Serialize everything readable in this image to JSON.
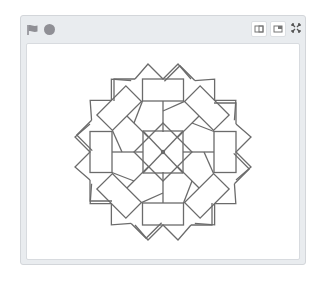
{
  "toolbar": {
    "green_flag": "green-flag-icon",
    "stop": "stop-icon",
    "buttons": [
      {
        "name": "small-stage-button",
        "icon": "small-stage-icon"
      },
      {
        "name": "normal-stage-button",
        "icon": "normal-stage-icon"
      },
      {
        "name": "fullscreen-button",
        "icon": "fullscreen-icon"
      }
    ]
  },
  "stage": {
    "drawing": "8-fold geometric pen pattern",
    "stroke_color": "#6b6b6b",
    "center": [
      163,
      152
    ],
    "symmetry": 8
  },
  "colors": {
    "frame_bg": "#e9ecef",
    "stage_bg": "#ffffff",
    "icon_gray": "#8f8f95"
  }
}
